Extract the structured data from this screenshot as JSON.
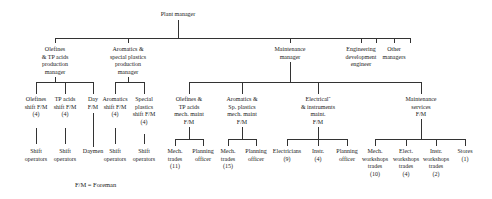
{
  "root": {
    "label": "Plant manager"
  },
  "level1": [
    {
      "label": "Olefines\n& TP acids\nproduction\nmanager"
    },
    {
      "label": "Aromatics &\nspecial plastics\nproduction\nmanager"
    },
    {
      "label": "Maintenance\nmanager"
    },
    {
      "label": "Engineering\ndevelopment\nengineer"
    },
    {
      "label": "Other\nmanagers"
    }
  ],
  "olefines_children": [
    {
      "label": "Olefines\nshift F/M\n(4)",
      "sub": "Shift\noperators"
    },
    {
      "label": "TP acids\nshift F/M\n(4)",
      "sub": "Shift\noperators"
    },
    {
      "label": "Day\nF/M",
      "sub": "Daymen"
    }
  ],
  "aromatics_children": [
    {
      "label": "Aromatics\nshift F/M\n(4)",
      "sub": "Shift\noperators"
    },
    {
      "label": "Special\nplastics\nshift F/M\n(4)",
      "sub": "Shift\noperators"
    }
  ],
  "maintenance_children": [
    {
      "label": "Olefines &\nTP acids\nmech. maint\nF/M",
      "children": [
        {
          "label": "Mech.\ntrades\n(11)"
        },
        {
          "label": "Planning\nofficer"
        }
      ]
    },
    {
      "label": "Aromatics &\nSp. plastics\nmech. maint\nF/M",
      "children": [
        {
          "label": "Mech.\ntrades\n(15)"
        },
        {
          "label": "Planning\nofficer"
        }
      ]
    },
    {
      "label": "Electrical˜\n& instruments\nmaint.\nF/M",
      "children": [
        {
          "label": "Electricians\n(9)"
        },
        {
          "label": "Instr.\n(4)"
        },
        {
          "label": "Planning\nofficer"
        }
      ]
    },
    {
      "label": "Maintenance\nservices\nF/M",
      "children": [
        {
          "label": "Mech.\nworkshops\ntrades\n(10)"
        },
        {
          "label": "Elect.\nworkshops\ntrades\n(4)"
        },
        {
          "label": "Instr.\nworkshops\ntrades\n(2)"
        },
        {
          "label": "Stores\n(1)"
        }
      ]
    }
  ],
  "legend": "F/M = Foreman"
}
